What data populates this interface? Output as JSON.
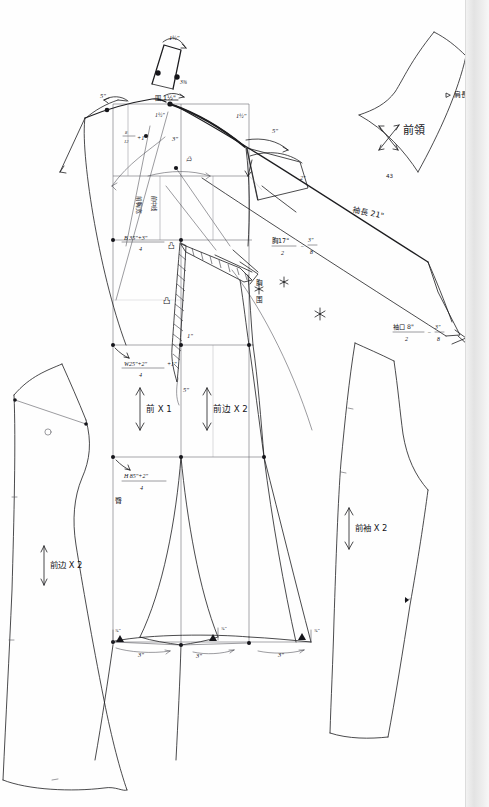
{
  "document": {
    "kind": "hand-drawn garment pattern draft",
    "medium": "pencil and ink on white paper (scanned)",
    "page_edge_note": "gray scanned page edge strip along right side",
    "background_color": "#fefefe",
    "ink_color": "#15151a"
  },
  "pieces": [
    {
      "id": "front-side-left",
      "label": "前边 X 2",
      "note": "left detached front side panel"
    },
    {
      "id": "front-bodice",
      "label": "前 X 1",
      "note": "center front main block"
    },
    {
      "id": "front-side-right",
      "label": "前边 X 2",
      "note": "right front side panel in main block"
    },
    {
      "id": "front-collar",
      "label": "前領",
      "note": "front collar / lapel piece, top right"
    },
    {
      "id": "front-sleeve",
      "label": "前袖 X 2",
      "note": "front sleeve piece, right"
    }
  ],
  "annotations": {
    "collar_piece_label": "前領",
    "collar_grain_label": "直丝",
    "shoulder_length_label": "肩長",
    "sleeve_length_label": "袖長 21\"",
    "sleeve_cuff_label": "袖口 8\"",
    "sleeve_cuff_formula_num": "袖口 8\"",
    "sleeve_cuff_formula_den": "2",
    "sleeve_cuff_formula_tail": "3\"",
    "sleeve_cuff_formula_tail_den": "8",
    "sleeve_piece_label": "前袖 X 2",
    "front_piece_label": "前 X 1",
    "front_side_label": "前边 X 2",
    "front_side_label_left": "前边 X 2",
    "bust_formula_num": "B 35\"+3\"",
    "bust_formula_den": "4",
    "waist_formula_num": "W25\"+2\"",
    "waist_formula_den": "4",
    "waist_formula_tail": "+1\"",
    "hip_formula_num": "H 85\"+2\"",
    "hip_formula_den": "4",
    "chest_formula_num": "胸17\"",
    "chest_formula_den": "2",
    "chest_formula_tail": "3\"",
    "chest_formula_tail_den": "8",
    "shoulder_slope_num": "8",
    "shoulder_slope_den": "12",
    "shoulder_slope_tail": "+1\"",
    "neck_label": "围 1½\"",
    "neck_drop_label": "1½\"",
    "collar_stand_label": "1½\"",
    "collar_top_label": "1½\"",
    "collar_width_label": "3⅜",
    "armhole_label": "1½\"",
    "five_inch_left": "5\"",
    "five_inch_right": "5\"",
    "three_inch_label": "3\"",
    "two_inch_label": "2\"",
    "one_inch_label": "1\"",
    "dart_five_label": "5\"",
    "sleeve_cap_label": "2\"",
    "chest_vert_a": "胸",
    "chest_vert_b": "围",
    "waist_vert": "腰",
    "hip_vert": "臀",
    "center_front_vert": "前中线",
    "bodice_vert_note": "前胸宽",
    "dart_icon": "凸",
    "small_mark_a": "⅜\"",
    "small_mark_b": "⅜\"",
    "small_mark_c": "⅜\"",
    "hem_a": "3\"",
    "hem_b": "3\"",
    "hem_c": "3\"",
    "collar_mark_43": "43"
  },
  "measurements": {
    "bust_in": 35,
    "bust_ease_in": 3,
    "waist_in": 25,
    "waist_ease_in": 2,
    "hip_in": 85,
    "hip_ease_in": 2,
    "chest_in": 17,
    "sleeve_length_in": 21,
    "sleeve_cuff_in": 8,
    "neck_rise_in": 1.5,
    "shoulder_in": 5,
    "hem_segments_in": [
      3,
      3,
      3
    ],
    "dart_length_in": 5,
    "divisor": 4
  }
}
